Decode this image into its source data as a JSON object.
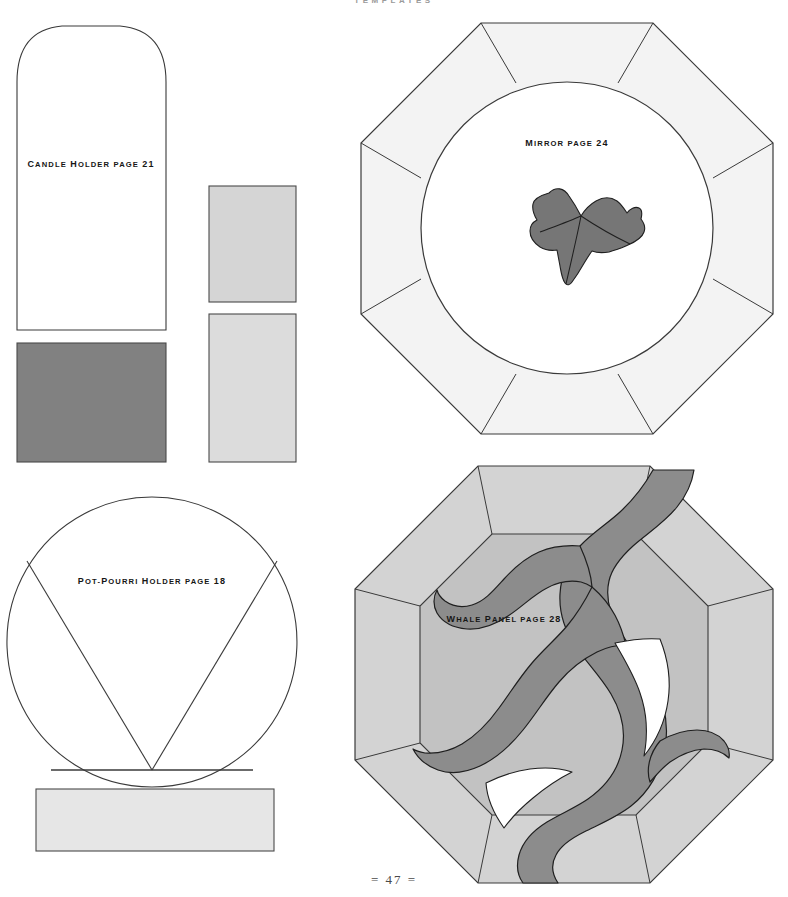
{
  "page": {
    "header": "TEMPLATES",
    "footer": "= 47 =",
    "background_color": "#ffffff",
    "outline_color": "#3a3a3a"
  },
  "templates": [
    {
      "id": "candle-holder",
      "label": "Candle Holder page 21",
      "name": "Candle Holder",
      "page_ref": "page 21",
      "shape": "arched-rectangle",
      "fill": "#ffffff"
    },
    {
      "id": "pot-pourri-holder",
      "label": "Pot-Pourri Holder page 18",
      "name": "Pot-Pourri Holder",
      "page_ref": "page 18",
      "shape": "circle-with-v-wedge",
      "fill": "#ffffff"
    },
    {
      "id": "mirror",
      "label": "Mirror page 24",
      "name": "Mirror",
      "page_ref": "page 24",
      "shape": "octagon-with-circle-and-ivy-leaf",
      "fill": "#f4f4f4"
    },
    {
      "id": "whale-panel",
      "label": "Whale Panel page 28",
      "name": "Whale Panel",
      "page_ref": "page 28",
      "shape": "octagon-with-whale",
      "fill": "#d2d2d2"
    }
  ],
  "pieces": [
    {
      "id": "candle-piece-light-upper",
      "color": "#d5d5d5",
      "note": "light grey rectangle"
    },
    {
      "id": "candle-piece-light-lower",
      "color": "#dcdcdc",
      "note": "light grey rectangle"
    },
    {
      "id": "candle-piece-dark",
      "color": "#818181",
      "note": "dark grey rectangle"
    },
    {
      "id": "pot-pourri-base-strip",
      "color": "#e6e6e6",
      "note": "light grey strip"
    }
  ],
  "colors": {
    "outline": "#3a3a3a",
    "leaf_grey": "#767676",
    "whale_grey": "#8c8c8c",
    "panel_border_grey": "#d3d3d3",
    "panel_field_grey": "#c2c2c2",
    "mirror_ring_grey": "#f3f3f3",
    "mirror_centre": "#ffffff",
    "dark_piece": "#818181",
    "light_piece": "#d5d5d5",
    "strip_piece": "#e6e6e6"
  }
}
